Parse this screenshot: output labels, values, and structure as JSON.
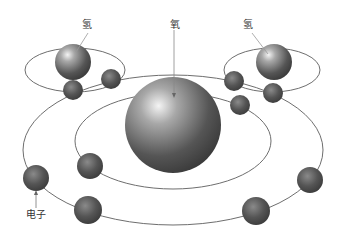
{
  "diagram": {
    "labels": {
      "hydrogen_left": "氢",
      "oxygen": "氧",
      "hydrogen_right": "氢",
      "electron": "电子"
    },
    "colors": {
      "orbit": "#6e6e6e",
      "nucleus_dark": "#3e3e3e",
      "nucleus_light": "#e8e8e8",
      "electron": "#4a4a4a",
      "label": "#333333"
    },
    "nuclei": [
      {
        "name": "hydrogen-left",
        "cx": 73,
        "cy": 62,
        "r": 18
      },
      {
        "name": "oxygen",
        "cx": 173,
        "cy": 125,
        "r": 48
      },
      {
        "name": "hydrogen-right",
        "cx": 274,
        "cy": 62,
        "r": 18
      }
    ],
    "orbits": [
      {
        "name": "hydrogen-left-orbit",
        "cx": 75,
        "cy": 70,
        "rx": 50,
        "ry": 22
      },
      {
        "name": "hydrogen-right-orbit",
        "cx": 272,
        "cy": 70,
        "rx": 48,
        "ry": 22
      },
      {
        "name": "oxygen-outer-orbit",
        "cx": 173,
        "cy": 150,
        "rx": 150,
        "ry": 75
      },
      {
        "name": "oxygen-inner-orbit",
        "cx": 173,
        "cy": 141,
        "rx": 98,
        "ry": 48
      }
    ],
    "electrons": [
      {
        "cx": 73,
        "cy": 90,
        "r": 10
      },
      {
        "cx": 111,
        "cy": 79,
        "r": 10
      },
      {
        "cx": 234,
        "cy": 81,
        "r": 10
      },
      {
        "cx": 273,
        "cy": 93,
        "r": 10
      },
      {
        "cx": 240,
        "cy": 105,
        "r": 10
      },
      {
        "cx": 90,
        "cy": 166,
        "r": 13
      },
      {
        "cx": 36,
        "cy": 178,
        "r": 13
      },
      {
        "cx": 88,
        "cy": 210,
        "r": 14
      },
      {
        "cx": 310,
        "cy": 180,
        "r": 13
      },
      {
        "cx": 256,
        "cy": 211,
        "r": 14
      }
    ]
  }
}
